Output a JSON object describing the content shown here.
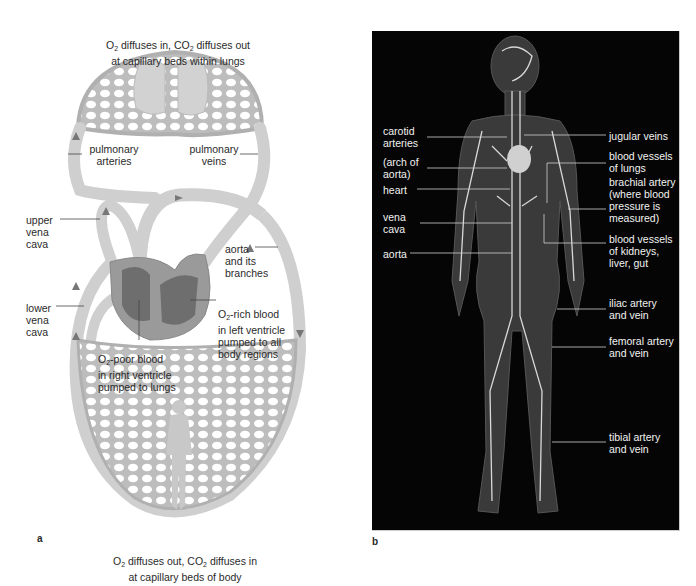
{
  "panel_a": {
    "letter": "a",
    "top_caption": {
      "line1_prefix": "O",
      "line1_sub1": "2",
      "line1_mid": " diffuses in, CO",
      "line1_sub2": "2",
      "line1_suffix": " diffuses out",
      "line2": "at capillary beds within lungs"
    },
    "bottom_caption": {
      "line1_prefix": "O",
      "line1_sub1": "2",
      "line1_mid": " diffuses out, CO",
      "line1_sub2": "2",
      "line1_suffix": " diffuses in",
      "line2": "at capillary beds of body"
    },
    "labels": {
      "pulmonary_arteries": "pulmonary\narteries",
      "pulmonary_veins": "pulmonary\nveins",
      "upper_vena_cava": "upper\nvena\ncava",
      "lower_vena_cava": "lower\nvena\ncava",
      "aorta": "aorta\nand its\nbranches",
      "o2_rich_prefix": "O",
      "o2_rich_sub": "2",
      "o2_rich_rest": "-rich blood\nin left ventricle\npumped to all\nbody regions",
      "o2_poor_prefix": "O",
      "o2_poor_sub": "2",
      "o2_poor_rest": "-poor blood\nin right ventricle\npumped to lungs"
    },
    "colors": {
      "vessel": "#cfcfcf",
      "vessel_edge": "#a9a9a9",
      "heart": "#9a9a9a",
      "heart_dark": "#6e6e6e",
      "arrow": "#777777"
    }
  },
  "panel_b": {
    "letter": "b",
    "labels_left": {
      "carotid": "carotid\narteries",
      "arch": "(arch of\naorta)",
      "heart": "heart",
      "vena_cava": "vena\ncava",
      "aorta": "aorta"
    },
    "labels_right": {
      "jugular": "jugular veins",
      "lungs": "blood vessels\nof lungs",
      "brachial": "brachial artery\n(where blood\npressure is\nmeasured)",
      "kidneys": "blood vessels\nof kidneys,\nliver, gut",
      "iliac": "iliac artery\nand vein",
      "femoral": "femoral artery\nand vein",
      "tibial": "tibial artery\nand vein"
    },
    "colors": {
      "background": "#050505",
      "body": "#3a3a3a",
      "vessel": "#d8d8d8",
      "text": "#f2f2f2"
    }
  }
}
